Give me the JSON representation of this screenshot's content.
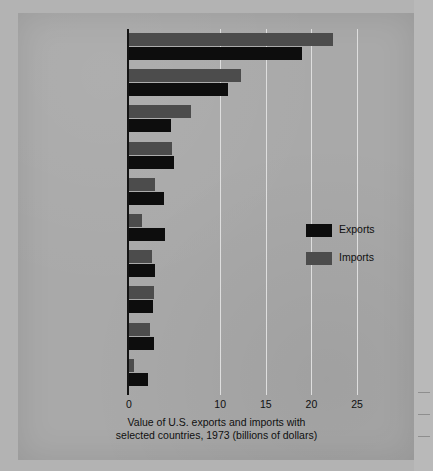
{
  "chart_data": {
    "type": "bar",
    "orientation": "horizontal",
    "title": "",
    "caption_line1": "Value of U.S. exports and imports with",
    "caption_line2": "selected countries, 1973 (billions of dollars)",
    "xlabel": "billions of dollars",
    "ylabel": "",
    "xlim": [
      0,
      25
    ],
    "grid": true,
    "grid_axis": "x",
    "xticks": [
      "0",
      "10",
      "15",
      "20",
      "25"
    ],
    "xtick_values": [
      0,
      10,
      15,
      20,
      25
    ],
    "legend_position": "middle-right",
    "categories": [
      "Canada",
      "Japan",
      "West Germany",
      "United Kingdom",
      "Mexico",
      "Netherlands",
      "France",
      "Italy",
      "Brazil",
      "Soviet Union"
    ],
    "series": [
      {
        "name": "Imports",
        "color": "#4c4c4c",
        "values": [
          22.4,
          12.3,
          6.8,
          4.7,
          2.8,
          1.4,
          2.5,
          2.7,
          2.3,
          0.5
        ]
      },
      {
        "name": "Exports",
        "color": "#0d0d0d",
        "values": [
          19.0,
          10.9,
          4.6,
          4.9,
          3.8,
          3.9,
          2.9,
          2.6,
          2.7,
          2.1
        ]
      }
    ]
  },
  "legend": {
    "items": [
      {
        "label": "Exports",
        "swatch": "exports"
      },
      {
        "label": "Imports",
        "swatch": "imports"
      }
    ]
  }
}
